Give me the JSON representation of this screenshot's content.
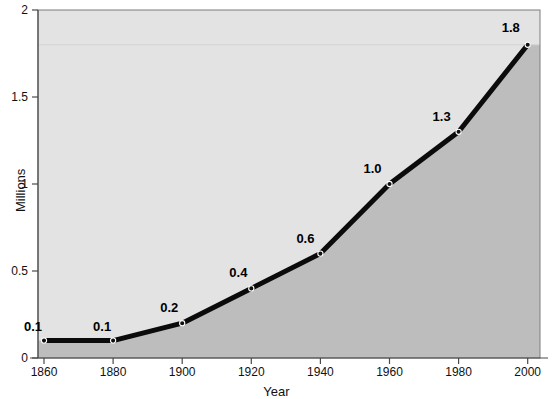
{
  "chart_data": {
    "type": "line",
    "title": "",
    "xlabel": "Year",
    "ylabel": "Millions",
    "xlim": [
      1860,
      2000
    ],
    "ylim": [
      0,
      2
    ],
    "grid": false,
    "legend": null,
    "x": [
      1860,
      1880,
      1900,
      1920,
      1940,
      1960,
      1980,
      2000
    ],
    "values": [
      0.1,
      0.1,
      0.2,
      0.4,
      0.6,
      1.0,
      1.3,
      1.8
    ],
    "point_labels": [
      "0.1",
      "0.1",
      "0.2",
      "0.4",
      "0.6",
      "1.0",
      "1.3",
      "1.8"
    ],
    "xtick_labels": [
      "1860",
      "1880",
      "1900",
      "1920",
      "1940",
      "1960",
      "1980",
      "2000"
    ],
    "ytick_values": [
      0,
      0.5,
      1,
      1.5,
      2
    ],
    "ytick_labels": [
      "0",
      "0.5",
      "1",
      "1.5",
      "2"
    ],
    "series": [
      {
        "name": "Millions",
        "values": [
          0.1,
          0.1,
          0.2,
          0.4,
          0.6,
          1.0,
          1.3,
          1.8
        ]
      }
    ],
    "style": {
      "line_color": "#0b0b0b",
      "marker_color": "#111111",
      "area_fill_color": "#bdbdbd",
      "plot_background_color": "#e3e3e3",
      "page_background_color": "#ffffff",
      "axis_color": "#4a4a4a",
      "label_color": "#111111"
    }
  }
}
